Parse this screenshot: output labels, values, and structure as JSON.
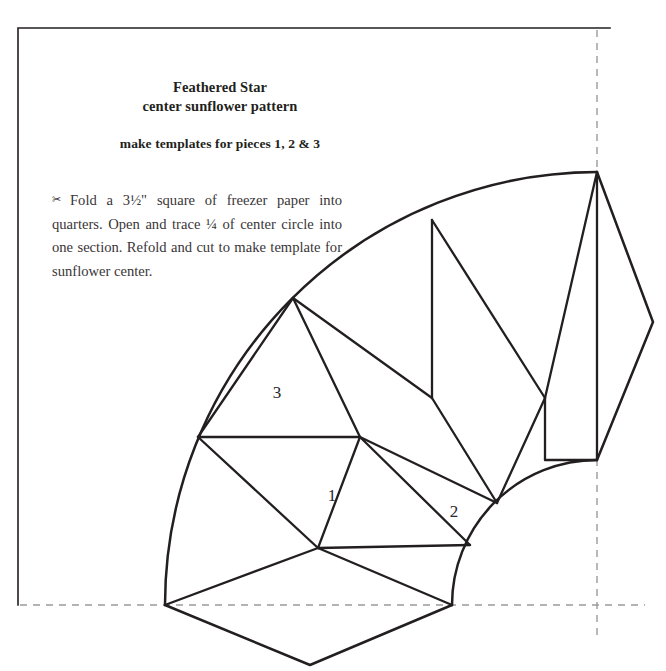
{
  "page": {
    "background": "#ffffff",
    "ink": "#231f20",
    "dashed_color": "#9b9b9b"
  },
  "title": {
    "line1": "Feathered Star",
    "line2": "center sunflower pattern"
  },
  "subtitle": "make templates for pieces 1, 2 & 3",
  "instructions": {
    "bullet": "✂",
    "body": "Fold a 3½\" square of freezer paper into quarters. Open and trace ¼ of center circle into one section. Refold and cut to make template for sunflower center."
  },
  "diagram": {
    "name": "feathered-star-sunflower-quarter-pattern",
    "stroke": "#231f20",
    "fill": "none",
    "fold_lines": {
      "style": "dashed",
      "color": "#9b9b9b",
      "vertical_x": 597,
      "horizontal_y": 605
    },
    "frame": {
      "left": 18,
      "top": 28,
      "right": 610,
      "bottom": 605
    },
    "arcs": {
      "center_x": 597,
      "center_y": 605,
      "outer_radius": 433,
      "inner_radius": 145
    },
    "piece_labels": [
      {
        "text": "1",
        "x": 332,
        "y": 496
      },
      {
        "text": "2",
        "x": 454,
        "y": 512
      },
      {
        "text": "3",
        "x": 277,
        "y": 393
      }
    ]
  }
}
